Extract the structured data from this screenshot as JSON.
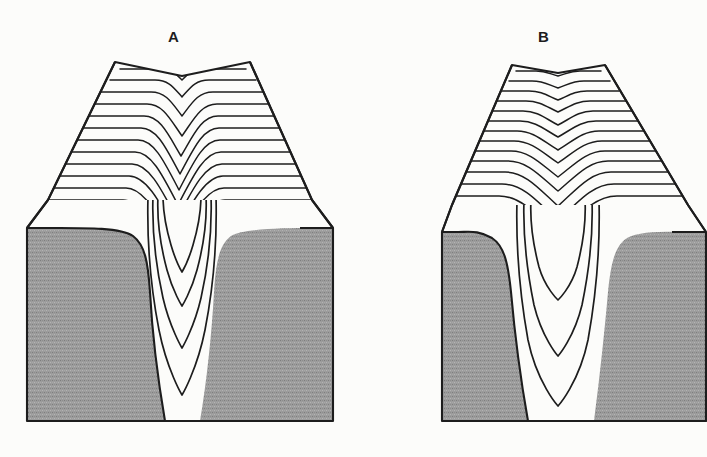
{
  "figure": {
    "kind": "geologic-block-diagram-pair",
    "caption_labels": [
      "A",
      "B"
    ],
    "background_color": "#fcfcfa",
    "line_color": "#1d1d1d",
    "bedrock_fill_color": "#9a9a9a",
    "surface_fill_color": "#ffffff"
  },
  "panels": [
    {
      "id": "A",
      "label": "A",
      "name": "block-diagram-a",
      "description": "Block diagram of a narrow V-shaped valley with closely nested contour lines",
      "valley_form": "narrow-deep-v",
      "contour_count_top_surface": 12,
      "subsurface_contour_count": 4,
      "block": {
        "left": 25,
        "right": 335,
        "bottom": 425,
        "front_face_top": 200,
        "ridge_top_y": 62,
        "ridge_left_x": 115,
        "ridge_right_x": 250,
        "notch_center_x": 182,
        "notch_depth": 14
      }
    },
    {
      "id": "B",
      "label": "B",
      "name": "block-diagram-b",
      "description": "Block diagram of a broader, shallower valley with widely spaced contour lines",
      "valley_form": "broad-shallow-v",
      "contour_count_top_surface": 13,
      "subsurface_contour_count": 3,
      "block": {
        "left": 440,
        "right": 710,
        "bottom": 425,
        "front_face_top": 205,
        "ridge_top_y": 65,
        "ridge_left_x": 512,
        "ridge_right_x": 605,
        "notch_center_x": 558,
        "notch_depth": 8
      }
    }
  ]
}
